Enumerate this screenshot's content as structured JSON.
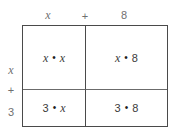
{
  "diagram": {
    "type": "area-model-multiplication",
    "column_headers": [
      {
        "label": "x",
        "kind": "variable"
      },
      {
        "label": "+",
        "kind": "operator"
      },
      {
        "label": "8",
        "kind": "number"
      }
    ],
    "row_headers": [
      {
        "label": "x",
        "kind": "variable"
      },
      {
        "label": "+",
        "kind": "operator"
      },
      {
        "label": "3",
        "kind": "number"
      }
    ],
    "multiply_symbol": "•",
    "cells": [
      {
        "position": "top-left",
        "left_factor": "x",
        "left_kind": "variable",
        "right_factor": "x",
        "right_kind": "variable",
        "text": "x • x"
      },
      {
        "position": "top-right",
        "left_factor": "x",
        "left_kind": "variable",
        "right_factor": "8",
        "right_kind": "number",
        "text": "x • 8"
      },
      {
        "position": "bottom-left",
        "left_factor": "3",
        "left_kind": "number",
        "right_factor": "x",
        "right_kind": "variable",
        "text": "3 • x"
      },
      {
        "position": "bottom-right",
        "left_factor": "3",
        "left_kind": "number",
        "right_factor": "8",
        "right_kind": "number",
        "text": "3 • 8"
      }
    ],
    "colors": {
      "background": "#ffffff",
      "border": "#4a4a4a",
      "inner_divider": "#6b6b6b",
      "header_text": "#6f6f6f",
      "cell_text": "#3b3b3b"
    }
  }
}
